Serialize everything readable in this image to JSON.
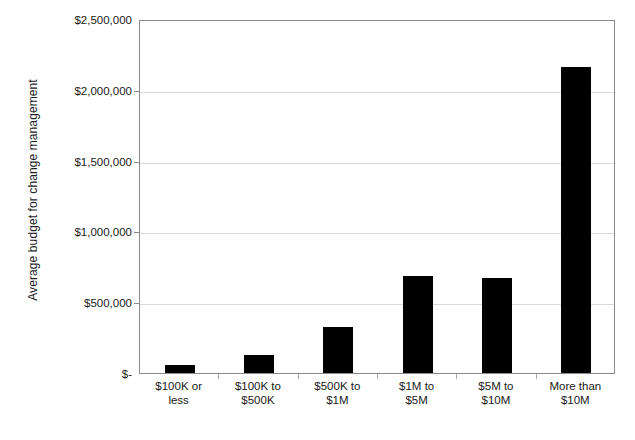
{
  "chart_data": {
    "type": "bar",
    "title": "",
    "xlabel": "",
    "ylabel": "Average budget for change management",
    "categories": [
      "$100K or less",
      "$100K to $500K",
      "$500K to $1M",
      "$1M to $5M",
      "$5M to $10M",
      "More than $10M"
    ],
    "category_lines": [
      [
        "$100K or",
        "less"
      ],
      [
        "$100K to",
        "$500K"
      ],
      [
        "$500K to",
        "$1M"
      ],
      [
        "$1M to",
        "$5M"
      ],
      [
        "$5M to",
        "$10M"
      ],
      [
        "More than",
        "$10M"
      ]
    ],
    "values": [
      55000,
      127000,
      325000,
      685000,
      670000,
      2160000
    ],
    "ylim": [
      0,
      2500000
    ],
    "ytick_values": [
      0,
      500000,
      1000000,
      1500000,
      2000000,
      2500000
    ],
    "ytick_labels": [
      "$-",
      "$500,000",
      "$1,000,000",
      "$1,500,000",
      "$2,000,000",
      "$2,500,000"
    ],
    "grid": true,
    "grid_axis": "y",
    "legend": false,
    "legend_position": "none",
    "series": [
      {
        "name": "Average budget for change management",
        "color": "#000000",
        "values": [
          55000,
          127000,
          325000,
          685000,
          670000,
          2160000
        ]
      }
    ],
    "colors": {
      "bar": "#000000",
      "gridline": "#d9d9d9",
      "axis": "#8a8a8a",
      "text": "#1a1a1a",
      "background": "#ffffff"
    }
  }
}
